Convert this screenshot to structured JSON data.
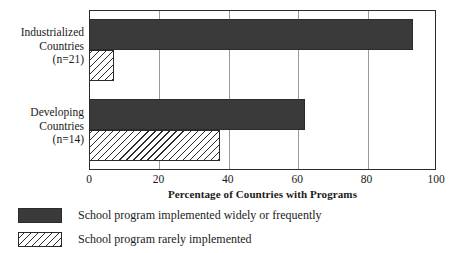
{
  "chart_data": {
    "type": "bar",
    "orientation": "horizontal",
    "title": "",
    "xlabel": "Percentage of Countries with Programs",
    "ylabel": "",
    "xlim": [
      0,
      100
    ],
    "xticks": [
      "0",
      "20",
      "40",
      "60",
      "80",
      "100"
    ],
    "grid": true,
    "legend_position": "below-plot",
    "categories": [
      "Industrialized Countries (n=21)",
      "Developing Countries (n=14)"
    ],
    "category_lines": [
      [
        "Industrialized",
        "Countries",
        "(n=21)"
      ],
      [
        "Developing",
        "Countries",
        "(n=14)"
      ]
    ],
    "series": [
      {
        "name": "School program implemented widely or frequently",
        "style": "solid-dark",
        "color": "#3a3a3a",
        "values": [
          93,
          62
        ]
      },
      {
        "name": "School program rarely implemented",
        "style": "diagonal-hatch",
        "color": "#ffffff",
        "values": [
          7,
          37.5
        ]
      }
    ]
  },
  "axis": {
    "xlabel": "Percentage of Countries with Programs",
    "ticks": [
      "0",
      "20",
      "40",
      "60",
      "80",
      "100"
    ]
  },
  "categories": {
    "industrialized": {
      "line1": "Industrialized",
      "line2": "Countries",
      "line3": "(n=21)"
    },
    "developing": {
      "line1": "Developing",
      "line2": "Countries",
      "line3": "(n=14)"
    }
  },
  "legend": {
    "items": [
      {
        "label": "School program implemented widely or frequently",
        "swatch": "solid-dark-swatch"
      },
      {
        "label": "School program rarely implemented",
        "swatch": "hatched-swatch"
      }
    ]
  }
}
